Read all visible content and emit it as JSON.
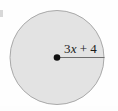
{
  "figure": {
    "type": "geometry-diagram",
    "shape": "circle",
    "background_color": "#fefefe",
    "circle": {
      "fill_color": "#e3e3e3",
      "stroke_color": "#a9a9a9",
      "stroke_width": 1,
      "center_x": 57,
      "center_y": 57.5,
      "radius": 47
    },
    "center_point": {
      "label": "",
      "color": "#111111",
      "radius": 3.2,
      "x": 57,
      "y": 57.5
    },
    "radius_segment": {
      "color": "#6e6e6e",
      "stroke_width": 1,
      "x1": 57,
      "y1": 57.5,
      "x2": 104,
      "y2": 57.5,
      "label": "3x + 4",
      "label_parts": {
        "coefficient": "3",
        "variable": "x",
        "operator": "+",
        "constant": "4"
      },
      "label_x": 64,
      "label_y": 52
    }
  }
}
